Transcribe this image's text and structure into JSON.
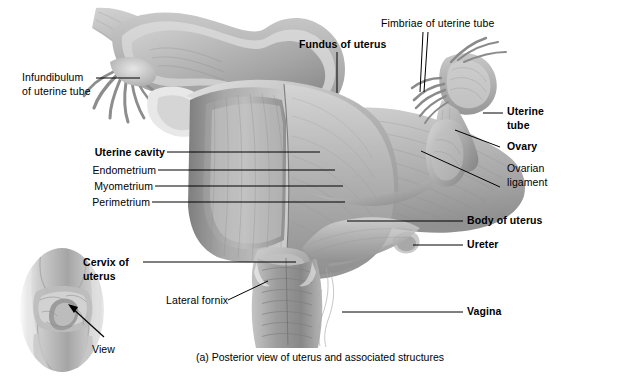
{
  "figure": {
    "caption": "(a) Posterior view of uterus and associated structures",
    "view_label": "View"
  },
  "labels": [
    {
      "id": "infundibulum",
      "text": "Infundibulum\nof uterine tube",
      "bold": false
    },
    {
      "id": "uterine-cavity",
      "text": "Uterine cavity",
      "bold": true
    },
    {
      "id": "endometrium",
      "text": "Endometrium",
      "bold": false
    },
    {
      "id": "myometrium",
      "text": "Myometrium",
      "bold": false
    },
    {
      "id": "perimetrium",
      "text": "Perimetrium",
      "bold": false
    },
    {
      "id": "cervix",
      "text": "Cervix of\nuterus",
      "bold": true
    },
    {
      "id": "lateral-fornix",
      "text": "Lateral fornix",
      "bold": false
    },
    {
      "id": "fundus",
      "text": "Fundus of uterus",
      "bold": true
    },
    {
      "id": "fimbriae",
      "text": "Fimbriae of uterine tube",
      "bold": false
    },
    {
      "id": "uterine-tube",
      "text": "Uterine\ntube",
      "bold": true
    },
    {
      "id": "ovary",
      "text": "Ovary",
      "bold": true
    },
    {
      "id": "ovarian-lig",
      "text": "Ovarian\nligament",
      "bold": false
    },
    {
      "id": "body-of-uterus",
      "text": "Body of uterus",
      "bold": true
    },
    {
      "id": "ureter",
      "text": "Ureter",
      "bold": true
    },
    {
      "id": "vagina",
      "text": "Vagina",
      "bold": true
    }
  ],
  "colors": {
    "background": "#ffffff",
    "ink": "#000000",
    "tissue_light": "#d8d8d8",
    "tissue_mid": "#b0b0b0",
    "tissue_dark": "#8a8a8a",
    "tissue_deep": "#6e6e6e",
    "inset_skin": "#c9c9c9"
  }
}
